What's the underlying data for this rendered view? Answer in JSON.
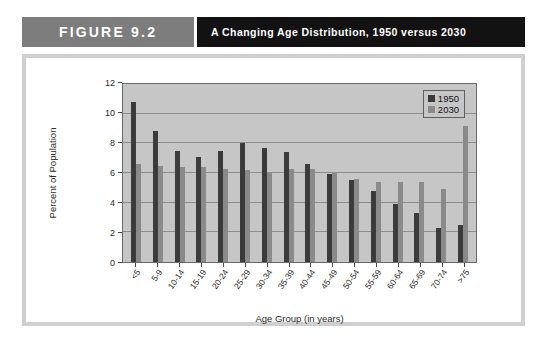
{
  "header": {
    "figure_label": "FIGURE 9.2",
    "title": "A Changing Age Distribution, 1950 versus 2030"
  },
  "chart_data": {
    "type": "bar",
    "title": "A Changing Age Distribution, 1950 versus 2030",
    "xlabel": "Age Group (in years)",
    "ylabel": "Percent of Population",
    "ylim": [
      0,
      12
    ],
    "yticks": [
      0,
      2,
      4,
      6,
      8,
      10,
      12
    ],
    "ytick_labels": [
      "0",
      "2",
      "4",
      "6",
      "8",
      "10",
      "12"
    ],
    "grid": true,
    "legend_position": "top-right",
    "categories": [
      "<5",
      "5-9",
      "10-14",
      "15-19",
      "20-24",
      "25-29",
      "30-34",
      "35-39",
      "40-44",
      "45-49",
      "50-54",
      "55-59",
      "60-64",
      "65-69",
      "70-74",
      ">75"
    ],
    "series": [
      {
        "name": "1950",
        "color": "#3b3b3b",
        "values": [
          10.8,
          8.8,
          7.5,
          7.1,
          7.5,
          8.0,
          7.7,
          7.4,
          6.6,
          5.9,
          5.5,
          4.8,
          3.9,
          3.3,
          2.3,
          2.5
        ]
      },
      {
        "name": "2030",
        "color": "#8a8a8a",
        "values": [
          6.6,
          6.5,
          6.4,
          6.4,
          6.3,
          6.2,
          6.0,
          6.3,
          6.3,
          6.0,
          5.6,
          5.4,
          5.4,
          5.4,
          4.9,
          9.2
        ]
      }
    ]
  },
  "colors": {
    "figure_tab_bg": "#7d7d7d",
    "title_bar_bg": "#121212",
    "plot_bg": "#c6c6c6",
    "frame_border": "#cfcfcf",
    "series_1950": "#3b3b3b",
    "series_2030": "#8a8a8a"
  }
}
